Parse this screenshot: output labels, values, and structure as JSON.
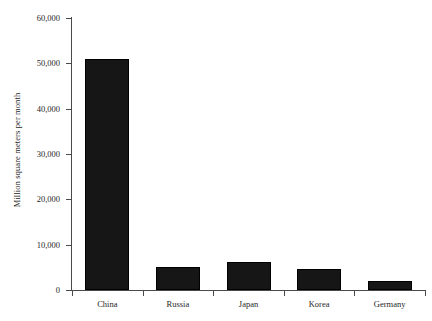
{
  "chart_data": {
    "type": "bar",
    "title": "",
    "subtitle": "",
    "xlabel": "",
    "ylabel": "Million square meters per month",
    "categories": [
      "China",
      "Russia",
      "Japan",
      "Korea",
      "Germany"
    ],
    "values": [
      51000,
      5000,
      6200,
      4600,
      2000
    ],
    "ylim": [
      0,
      60000
    ],
    "ytick_labels": [
      "0",
      "10,000",
      "20,000",
      "30,000",
      "40,000",
      "50,000",
      "60,000"
    ],
    "ytick_values": [
      0,
      10000,
      20000,
      30000,
      40000,
      50000,
      60000
    ],
    "grid": false,
    "legend": false,
    "legend_position": "none",
    "bar_color": "#161616",
    "axis_color": "#4a4a4a",
    "background_color": "#ffffff"
  }
}
